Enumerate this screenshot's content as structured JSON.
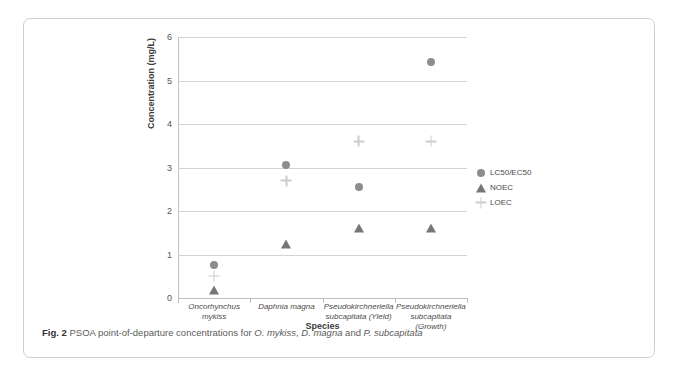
{
  "caption": {
    "label": "Fig. 2",
    "text_part1": "PSOA point-of-departure concentrations for ",
    "species1": "O. mykiss",
    "sep1": ", ",
    "species2": "D. magna",
    "sep2": " and ",
    "species3": "P. subcapitata"
  },
  "chart_data": {
    "type": "scatter",
    "title": "",
    "xlabel": "Species",
    "ylabel": "Concentration (mg/L)",
    "ylim": [
      0,
      6
    ],
    "yticks": [
      0,
      1,
      2,
      3,
      4,
      5,
      6
    ],
    "ytick_labels": [
      "0",
      "1",
      "2",
      "3",
      "4",
      "5",
      "6"
    ],
    "grid": true,
    "legend_position": "right",
    "categories": [
      "Oncorhynchus mykiss",
      "Daphnia magna",
      "Pseudokirchneriella subcapitata (Yield)",
      "Pseudokirchneriella subcapitata (Growth)"
    ],
    "category_label_lines": [
      [
        "Oncorhynchus",
        "mykiss"
      ],
      [
        "Daphnia magna"
      ],
      [
        "Pseudokirchneriella",
        "subcapitata (Yield)"
      ],
      [
        "Pseudokirchneriella",
        "subcapitata",
        "(Growth)"
      ]
    ],
    "series": [
      {
        "name": "LC50/EC50",
        "marker": "circle",
        "color": "#8d8d8d",
        "values": [
          0.75,
          3.05,
          2.56,
          5.42
        ]
      },
      {
        "name": "NOEC",
        "marker": "triangle",
        "color": "#767676",
        "values": [
          0.23,
          1.28,
          1.66,
          1.66
        ]
      },
      {
        "name": "LOEC",
        "marker": "plus",
        "color": "#cccccc",
        "values": [
          0.5,
          2.7,
          3.6,
          3.6
        ]
      }
    ]
  }
}
